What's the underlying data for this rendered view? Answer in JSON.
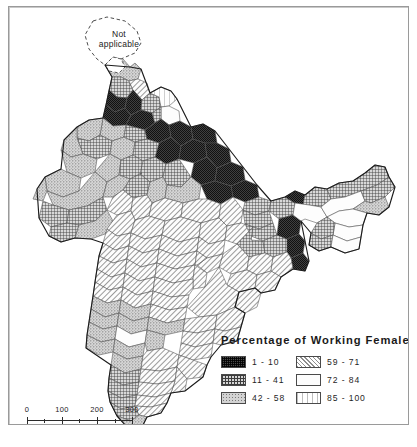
{
  "map": {
    "title_annotation": "Not applicable",
    "annotation_lines": [
      "Not",
      "applicable"
    ],
    "region": "India",
    "theme": "Percentage of Working Females by district"
  },
  "scale": {
    "ticks": [
      "0",
      "100",
      "200",
      "300"
    ],
    "unit_label": "miles"
  },
  "legend": {
    "title": "Percentage of Working Females",
    "columns": [
      {
        "items": [
          {
            "label": "1 - 10",
            "pattern": "dense-dark-checker",
            "class": "p-c1"
          },
          {
            "label": "11 - 41",
            "pattern": "cross-hatch-grid",
            "class": "p-c2"
          },
          {
            "label": "42 - 58",
            "pattern": "medium-stipple",
            "class": "p-c3"
          }
        ]
      },
      {
        "items": [
          {
            "label": "59 - 71",
            "pattern": "diagonal-hatch",
            "class": "p-c4"
          },
          {
            "label": "72 - 84",
            "pattern": "solid-white",
            "class": "p-c5"
          },
          {
            "label": "85 - 100",
            "pattern": "vertical-lines",
            "class": "p-c6"
          }
        ]
      }
    ]
  },
  "colors": {
    "frame": "#9a9a9a",
    "outline": "#222222",
    "district_outline": "#555555",
    "background": "#ffffff",
    "class_1_10": "#3a3a3a",
    "class_11_41": "#8f8f8f",
    "class_42_58": "#c9c9c9",
    "class_59_71": "#e2e2e2",
    "class_72_84": "#fcfcfc",
    "class_85_100": "#f6f6f6"
  }
}
